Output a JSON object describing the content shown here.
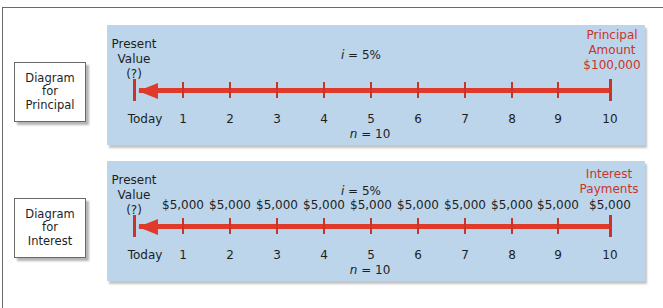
{
  "colors": {
    "panel_bg": "#bcd5ea",
    "accent_red": "#c9342a",
    "arrow_red": "#e03a2a"
  },
  "diagrams": [
    {
      "side_label": [
        "Diagram",
        "for",
        "Principal"
      ],
      "present_value": [
        "Present",
        "Value",
        "(?)"
      ],
      "rate_var": "i",
      "rate_text": " = 5%",
      "periods_var": "n",
      "periods_text": " = 10",
      "end_label": [
        "Principal",
        "Amount",
        "$100,000"
      ],
      "timeline": [
        "Today",
        "1",
        "2",
        "3",
        "4",
        "5",
        "6",
        "7",
        "8",
        "9",
        "10"
      ],
      "payments": []
    },
    {
      "side_label": [
        "Diagram",
        "for",
        "Interest"
      ],
      "present_value": [
        "Present",
        "Value",
        "(?)"
      ],
      "rate_var": "i",
      "rate_text": " = 5%",
      "periods_var": "n",
      "periods_text": " = 10",
      "end_label": [
        "Interest",
        "Payments"
      ],
      "timeline": [
        "Today",
        "1",
        "2",
        "3",
        "4",
        "5",
        "6",
        "7",
        "8",
        "9",
        "10"
      ],
      "payments": [
        "$5,000",
        "$5,000",
        "$5,000",
        "$5,000",
        "$5,000",
        "$5,000",
        "$5,000",
        "$5,000",
        "$5,000",
        "$5,000"
      ]
    }
  ]
}
